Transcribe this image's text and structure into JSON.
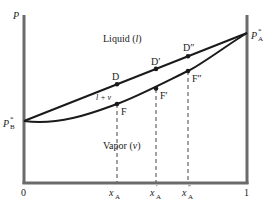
{
  "diagram": {
    "type": "pressure-composition phase diagram",
    "axes": {
      "y_label": "P",
      "x_ticks": [
        {
          "label": "0",
          "value": 0
        },
        {
          "label": "x",
          "sub": "A",
          "sup": "",
          "value": 0.42
        },
        {
          "label": "x",
          "sub": "A",
          "sup": "′",
          "value": 0.595
        },
        {
          "label": "x",
          "sub": "A",
          "sup": "″",
          "value": 0.735
        },
        {
          "label": "1",
          "value": 1
        }
      ]
    },
    "endpoints": {
      "left": {
        "label": "P",
        "sup": "*",
        "sub": "B"
      },
      "right": {
        "label": "P",
        "sup": "*",
        "sub": "A"
      }
    },
    "regions": {
      "liquid": {
        "text": "Liquid (",
        "var": "l",
        "close": ")"
      },
      "vapor": {
        "text": "Vapor (",
        "var": "v",
        "close": ")"
      },
      "two_phase": {
        "text": "l + v"
      }
    },
    "points": {
      "liquid_line": [
        {
          "name": "D",
          "label": "D"
        },
        {
          "name": "D-prime",
          "label": "D′"
        },
        {
          "name": "D-double-prime",
          "label": "D″"
        }
      ],
      "vapor_curve": [
        {
          "name": "F",
          "label": "F"
        },
        {
          "name": "F-prime",
          "label": "F′"
        },
        {
          "name": "F-double-prime",
          "label": "F″"
        }
      ]
    },
    "colors": {
      "axis": "#6b6b6b",
      "curve": "#1a1a1a",
      "text": "#222222"
    }
  }
}
